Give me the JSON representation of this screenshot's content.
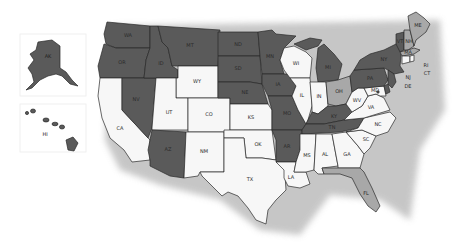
{
  "map": {
    "title": "United States state map",
    "legend_colors": {
      "dark": "#5a5a5a",
      "light": "#a8a8a8",
      "white": "#f7f7f7"
    },
    "insets": [
      {
        "id": "AK",
        "label": "AK",
        "shade": "dark"
      },
      {
        "id": "HI",
        "label": "HI",
        "shade": "dark"
      }
    ],
    "states": {
      "WA": {
        "label": "WA",
        "shade": "dark"
      },
      "OR": {
        "label": "OR",
        "shade": "dark"
      },
      "CA": {
        "label": "CA",
        "shade": "white"
      },
      "ID": {
        "label": "ID",
        "shade": "dark"
      },
      "NV": {
        "label": "NV",
        "shade": "dark"
      },
      "MT": {
        "label": "MT",
        "shade": "dark"
      },
      "WY": {
        "label": "WY",
        "shade": "white"
      },
      "UT": {
        "label": "UT",
        "shade": "white"
      },
      "AZ": {
        "label": "AZ",
        "shade": "dark"
      },
      "CO": {
        "label": "CO",
        "shade": "white"
      },
      "NM": {
        "label": "NM",
        "shade": "white"
      },
      "ND": {
        "label": "ND",
        "shade": "dark"
      },
      "SD": {
        "label": "SD",
        "shade": "dark"
      },
      "NE": {
        "label": "NE",
        "shade": "dark"
      },
      "KS": {
        "label": "KS",
        "shade": "white"
      },
      "OK": {
        "label": "OK",
        "shade": "white"
      },
      "TX": {
        "label": "TX",
        "shade": "white"
      },
      "MN": {
        "label": "MN",
        "shade": "dark"
      },
      "IA": {
        "label": "IA",
        "shade": "dark"
      },
      "MO": {
        "label": "MO",
        "shade": "dark"
      },
      "AR": {
        "label": "AR",
        "shade": "dark"
      },
      "LA": {
        "label": "LA",
        "shade": "white"
      },
      "WI": {
        "label": "WI",
        "shade": "white"
      },
      "IL": {
        "label": "IL",
        "shade": "white"
      },
      "MI": {
        "label": "MI",
        "shade": "dark"
      },
      "IN": {
        "label": "IN",
        "shade": "white"
      },
      "OH": {
        "label": "OH",
        "shade": "light"
      },
      "KY": {
        "label": "KY",
        "shade": "dark"
      },
      "TN": {
        "label": "TN",
        "shade": "dark"
      },
      "MS": {
        "label": "MS",
        "shade": "white"
      },
      "AL": {
        "label": "AL",
        "shade": "white"
      },
      "GA": {
        "label": "GA",
        "shade": "white"
      },
      "FL": {
        "label": "FL",
        "shade": "light"
      },
      "SC": {
        "label": "SC",
        "shade": "white"
      },
      "NC": {
        "label": "NC",
        "shade": "white"
      },
      "VA": {
        "label": "VA",
        "shade": "white"
      },
      "WV": {
        "label": "WV",
        "shade": "white"
      },
      "PA": {
        "label": "PA",
        "shade": "dark"
      },
      "NY": {
        "label": "NY",
        "shade": "dark"
      },
      "VT": {
        "label": "VT",
        "shade": "dark"
      },
      "NH": {
        "label": "NH",
        "shade": "light"
      },
      "ME": {
        "label": "ME",
        "shade": "light"
      },
      "MA": {
        "label": "MA",
        "shade": "light"
      },
      "RI": {
        "label": "RI",
        "shade": "white"
      },
      "CT": {
        "label": "CT",
        "shade": "white"
      },
      "NJ": {
        "label": "NJ",
        "shade": "dark"
      },
      "DE": {
        "label": "DE",
        "shade": "dark"
      },
      "MD": {
        "label": "MD",
        "shade": "white"
      },
      "DC": {
        "label": "DC",
        "shade": "dark"
      }
    }
  }
}
